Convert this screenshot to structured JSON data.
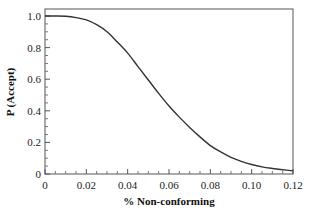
{
  "chart_data": {
    "type": "line",
    "title": "",
    "xlabel": "% Non-conforming",
    "ylabel": "P (Accept)",
    "xlim": [
      0,
      0.12
    ],
    "ylim": [
      0,
      1.0
    ],
    "grid": false,
    "legend": null,
    "x_ticks": [
      "0",
      "0.02",
      "0.04",
      "0.06",
      "0.08",
      "0.10",
      "0.12"
    ],
    "y_ticks": [
      "0",
      "0.2",
      "0.4",
      "0.6",
      "0.8",
      "1.0"
    ],
    "series": [
      {
        "name": "OC curve",
        "color": "#333333",
        "x": [
          0,
          0.005,
          0.01,
          0.015,
          0.02,
          0.025,
          0.03,
          0.035,
          0.04,
          0.045,
          0.05,
          0.055,
          0.06,
          0.065,
          0.07,
          0.075,
          0.08,
          0.085,
          0.09,
          0.095,
          0.1,
          0.105,
          0.11,
          0.115,
          0.12
        ],
        "y": [
          1.0,
          1.0,
          0.998,
          0.99,
          0.975,
          0.945,
          0.9,
          0.835,
          0.765,
          0.68,
          0.595,
          0.51,
          0.43,
          0.36,
          0.295,
          0.235,
          0.18,
          0.14,
          0.105,
          0.08,
          0.06,
          0.045,
          0.035,
          0.027,
          0.02
        ]
      }
    ]
  }
}
